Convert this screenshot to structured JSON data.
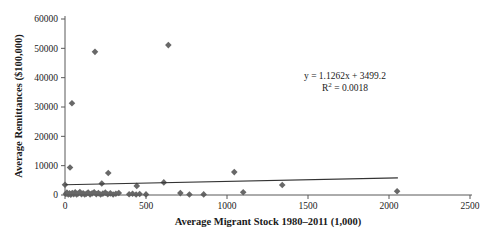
{
  "chart_data": {
    "type": "scatter",
    "title": "",
    "xlabel": "Average Migrant Stock 1980–2011 (1,000)",
    "ylabel": "Average Remittances ($100,000)",
    "xlim": [
      0,
      2500
    ],
    "ylim": [
      0,
      60000
    ],
    "x_ticks": [
      0,
      500,
      1000,
      1500,
      2000,
      2500
    ],
    "x_tick_labels": [
      "0",
      "500",
      "1000",
      "1500",
      "2000",
      "2500"
    ],
    "y_ticks": [
      0,
      10000,
      20000,
      30000,
      40000,
      50000,
      60000
    ],
    "y_tick_labels": [
      "0",
      "10000",
      "20000",
      "30000",
      "40000",
      "50000",
      "60000"
    ],
    "grid": false,
    "legend": "none",
    "marker_shape": "diamond",
    "points": [
      [
        43,
        31300
      ],
      [
        185,
        48800
      ],
      [
        638,
        51100
      ],
      [
        31,
        9400
      ],
      [
        267,
        7500
      ],
      [
        1045,
        7800
      ],
      [
        0,
        3500
      ],
      [
        227,
        3900
      ],
      [
        443,
        3100
      ],
      [
        610,
        4300
      ],
      [
        1341,
        3400
      ],
      [
        2050,
        1300
      ],
      [
        5,
        350
      ],
      [
        12,
        800
      ],
      [
        20,
        200
      ],
      [
        28,
        550
      ],
      [
        36,
        120
      ],
      [
        45,
        700
      ],
      [
        54,
        300
      ],
      [
        63,
        900
      ],
      [
        72,
        180
      ],
      [
        81,
        500
      ],
      [
        92,
        1000
      ],
      [
        102,
        250
      ],
      [
        112,
        600
      ],
      [
        122,
        150
      ],
      [
        132,
        450
      ],
      [
        143,
        850
      ],
      [
        155,
        220
      ],
      [
        167,
        550
      ],
      [
        180,
        950
      ],
      [
        193,
        300
      ],
      [
        206,
        650
      ],
      [
        220,
        180
      ],
      [
        234,
        480
      ],
      [
        249,
        800
      ],
      [
        264,
        260
      ],
      [
        280,
        560
      ],
      [
        297,
        150
      ],
      [
        314,
        420
      ],
      [
        332,
        700
      ],
      [
        396,
        250
      ],
      [
        417,
        420
      ],
      [
        439,
        160
      ],
      [
        461,
        320
      ],
      [
        500,
        200
      ],
      [
        712,
        650
      ],
      [
        768,
        160
      ],
      [
        856,
        210
      ],
      [
        1100,
        950
      ]
    ],
    "trendline": {
      "slope": 1.1262,
      "intercept": 3499.2,
      "x_start": 0,
      "x_end": 2055
    },
    "annotation": {
      "equation": "y = 1.1262x + 3499.2",
      "r2_prefix": "R",
      "r2_sup": "2",
      "r2_suffix": " = 0.0018"
    },
    "colors": {
      "marker": "#686868",
      "trendline": "#333333",
      "axis": "#595959",
      "text": "#1a1a1a",
      "background": "#ffffff"
    }
  }
}
